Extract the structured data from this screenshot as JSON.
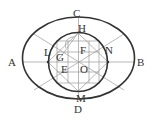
{
  "diagram": {
    "type": "geometric-construction",
    "colors": {
      "thick_stroke": "#333333",
      "thin_stroke": "#9a9a9a",
      "background": "#ffffff",
      "label": "#333333"
    },
    "outer_ellipse": {
      "cx": 78.5,
      "cy": 58,
      "rx": 56,
      "ry": 41
    },
    "inner_circle": {
      "cx": 78,
      "cy": 62,
      "r": 29.5
    },
    "labels": {
      "A": {
        "text": "A",
        "x": 8,
        "y": 66
      },
      "B": {
        "text": "B",
        "x": 137,
        "y": 66
      },
      "C": {
        "text": "C",
        "x": 73,
        "y": 17
      },
      "D": {
        "text": "D",
        "x": 74,
        "y": 113
      },
      "H": {
        "text": "H",
        "x": 78,
        "y": 32
      },
      "L": {
        "text": "L",
        "x": 44,
        "y": 56
      },
      "N": {
        "text": "N",
        "x": 105,
        "y": 54
      },
      "F": {
        "text": "F",
        "x": 80,
        "y": 54
      },
      "G": {
        "text": "G",
        "x": 56,
        "y": 61
      },
      "E": {
        "text": "E",
        "x": 61,
        "y": 73
      },
      "O": {
        "text": "O",
        "x": 80,
        "y": 73
      },
      "M": {
        "text": "M",
        "x": 76,
        "y": 102
      }
    }
  }
}
